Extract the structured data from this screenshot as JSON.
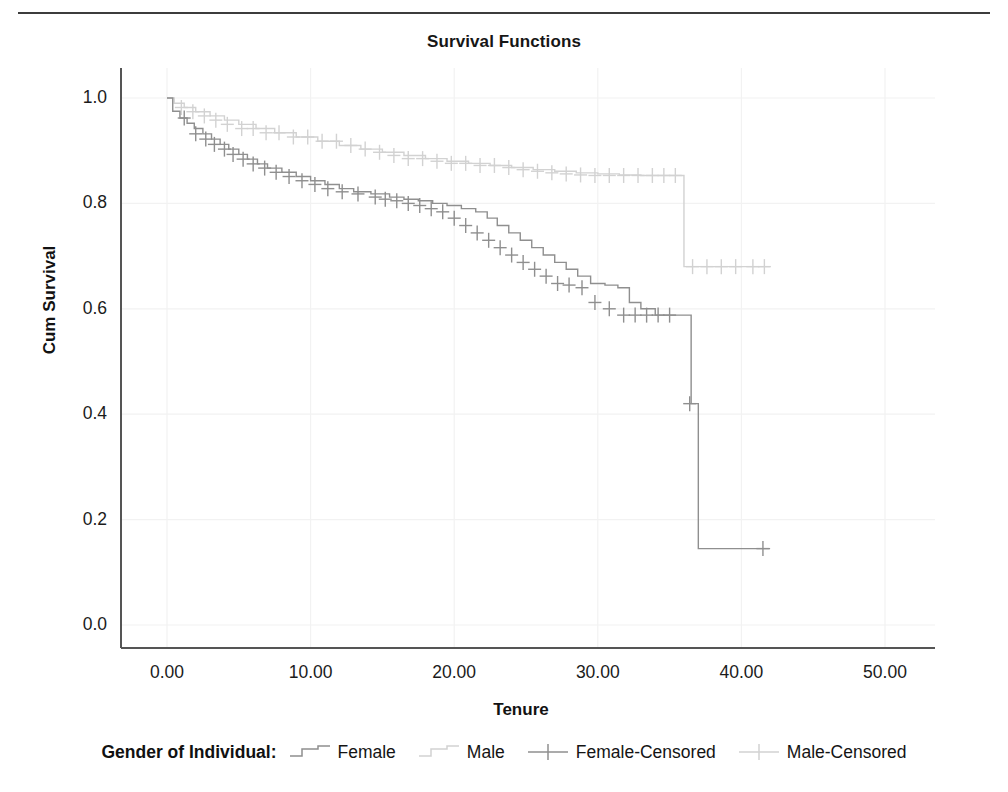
{
  "page": {
    "background": "#ffffff",
    "top_rule_color": "#3c3c3c"
  },
  "chart": {
    "title": "Survival Functions",
    "xlabel": "Tenure",
    "ylabel": "Cum Survival",
    "legend_title": "Gender of Individual:"
  },
  "colors": {
    "female": "#8f8f8f",
    "male": "#d2d2d2",
    "axis": "#555555",
    "grid": "#f2f2f2",
    "text": "#161616"
  },
  "chart_data": {
    "type": "line",
    "subtype": "kaplan-meier-survival-step",
    "title": "Survival Functions",
    "xlabel": "Tenure",
    "ylabel": "Cum Survival",
    "xlim": [
      -1.5,
      53.5
    ],
    "ylim": [
      0.0,
      1.05
    ],
    "xticks": [
      "0.00",
      "10.00",
      "20.00",
      "30.00",
      "40.00",
      "50.00"
    ],
    "xtick_values": [
      0,
      10,
      20,
      30,
      40,
      50
    ],
    "yticks": [
      "0.0",
      "0.2",
      "0.4",
      "0.6",
      "0.8",
      "1.0"
    ],
    "ytick_values": [
      0.0,
      0.2,
      0.4,
      0.6,
      0.8,
      1.0
    ],
    "grid": true,
    "legend_position": "bottom",
    "legend_title": "Gender of Individual:",
    "series": [
      {
        "name": "Female",
        "color": "#8f8f8f",
        "style": "step",
        "censored_name": "Female-Censored",
        "x": [
          0.0,
          0.4,
          0.9,
          1.4,
          1.9,
          2.5,
          3.1,
          3.7,
          4.3,
          5.0,
          5.6,
          6.3,
          7.0,
          8.0,
          9.0,
          10.0,
          11.0,
          12.0,
          13.0,
          14.2,
          15.5,
          16.5,
          17.5,
          18.5,
          19.5,
          20.5,
          21.5,
          22.3,
          23.0,
          23.8,
          24.6,
          25.4,
          26.2,
          27.0,
          27.8,
          28.6,
          29.5,
          30.5,
          31.4,
          32.2,
          33.0,
          34.0,
          35.0,
          36.0,
          36.5,
          37.0,
          42.0
        ],
        "y": [
          1.0,
          0.975,
          0.962,
          0.952,
          0.942,
          0.932,
          0.922,
          0.912,
          0.903,
          0.893,
          0.884,
          0.875,
          0.867,
          0.859,
          0.851,
          0.843,
          0.836,
          0.828,
          0.822,
          0.818,
          0.812,
          0.808,
          0.805,
          0.8,
          0.796,
          0.79,
          0.784,
          0.772,
          0.758,
          0.744,
          0.73,
          0.716,
          0.702,
          0.688,
          0.675,
          0.662,
          0.648,
          0.645,
          0.64,
          0.612,
          0.6,
          0.588,
          0.588,
          0.588,
          0.42,
          0.145,
          0.145
        ],
        "censored_x": [
          1.2,
          2.0,
          2.7,
          3.3,
          4.0,
          4.6,
          5.3,
          6.0,
          6.8,
          7.6,
          8.5,
          9.4,
          10.3,
          11.2,
          12.2,
          13.3,
          14.5,
          15.2,
          16.0,
          16.8,
          17.6,
          18.4,
          19.2,
          20.0,
          20.8,
          21.6,
          22.4,
          23.2,
          24.0,
          24.8,
          25.6,
          26.4,
          27.2,
          28.0,
          28.9,
          29.8,
          30.8,
          31.8,
          32.6,
          33.4,
          34.2,
          35.0,
          36.4,
          41.5
        ],
        "censored_y": [
          0.962,
          0.932,
          0.922,
          0.912,
          0.903,
          0.893,
          0.884,
          0.875,
          0.867,
          0.859,
          0.851,
          0.843,
          0.836,
          0.828,
          0.822,
          0.818,
          0.812,
          0.808,
          0.805,
          0.8,
          0.796,
          0.79,
          0.784,
          0.772,
          0.758,
          0.744,
          0.73,
          0.716,
          0.702,
          0.688,
          0.675,
          0.662,
          0.648,
          0.645,
          0.64,
          0.612,
          0.6,
          0.588,
          0.588,
          0.588,
          0.588,
          0.588,
          0.42,
          0.145
        ]
      },
      {
        "name": "Male",
        "color": "#d2d2d2",
        "style": "step",
        "censored_name": "Male-Censored",
        "x": [
          0.0,
          0.5,
          1.2,
          2.0,
          3.0,
          4.0,
          5.0,
          6.2,
          7.5,
          9.0,
          10.5,
          12.0,
          13.5,
          15.0,
          16.5,
          18.0,
          19.5,
          21.0,
          22.5,
          24.0,
          25.5,
          27.0,
          28.5,
          30.0,
          31.5,
          33.0,
          34.5,
          35.7,
          36.0,
          42.0
        ],
        "y": [
          1.0,
          0.99,
          0.982,
          0.974,
          0.966,
          0.958,
          0.95,
          0.942,
          0.934,
          0.926,
          0.918,
          0.91,
          0.903,
          0.897,
          0.891,
          0.885,
          0.88,
          0.876,
          0.872,
          0.868,
          0.864,
          0.861,
          0.858,
          0.856,
          0.854,
          0.853,
          0.853,
          0.853,
          0.68,
          0.68
        ],
        "censored_x": [
          1.0,
          1.8,
          2.6,
          3.4,
          4.2,
          5.2,
          6.0,
          6.9,
          7.8,
          8.8,
          9.8,
          10.8,
          11.8,
          12.8,
          13.8,
          14.8,
          15.8,
          16.8,
          17.8,
          18.8,
          19.8,
          20.8,
          21.8,
          22.8,
          23.8,
          24.8,
          25.8,
          26.8,
          27.8,
          28.8,
          29.8,
          30.8,
          31.8,
          32.8,
          33.8,
          34.6,
          35.4,
          36.6,
          37.6,
          38.6,
          39.6,
          40.8,
          41.6
        ],
        "censored_y": [
          0.982,
          0.974,
          0.966,
          0.958,
          0.95,
          0.942,
          0.942,
          0.934,
          0.934,
          0.926,
          0.926,
          0.918,
          0.918,
          0.91,
          0.903,
          0.897,
          0.891,
          0.885,
          0.885,
          0.88,
          0.876,
          0.876,
          0.872,
          0.872,
          0.868,
          0.864,
          0.861,
          0.858,
          0.856,
          0.854,
          0.853,
          0.853,
          0.853,
          0.853,
          0.853,
          0.853,
          0.853,
          0.68,
          0.68,
          0.68,
          0.68,
          0.68,
          0.68
        ]
      }
    ]
  },
  "legend_items": [
    {
      "label": "Female",
      "symbol": "step-line",
      "color": "#8f8f8f"
    },
    {
      "label": "Male",
      "symbol": "step-line",
      "color": "#d2d2d2"
    },
    {
      "label": "Female-Censored",
      "symbol": "plus-mark",
      "color": "#8f8f8f"
    },
    {
      "label": "Male-Censored",
      "symbol": "plus-mark",
      "color": "#d2d2d2"
    }
  ]
}
